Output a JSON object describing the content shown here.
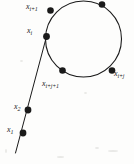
{
  "figure": {
    "background_color": "#fdfdfc",
    "ink_color": "#1a1a1a",
    "width": 134,
    "height": 164
  },
  "geometry": {
    "cycle": {
      "shape": "circle",
      "center_x": 83.5,
      "center_y": 39,
      "radius": 38,
      "stroke_width": 1.1
    },
    "tail": {
      "shape": "line",
      "from_x": 46.5,
      "from_y": 36.5,
      "to_x": 15.5,
      "to_y": 153,
      "stroke_width": 1.0
    }
  },
  "nodes": [
    {
      "id": "x_i_plus_1",
      "cx": 50.5,
      "cy": 10.5,
      "r": 3.3,
      "base": "x",
      "sub": "i+1",
      "label_x": 26,
      "label_y": 3,
      "label_align": "left"
    },
    {
      "id": "x_i_plus_2",
      "cx": 102,
      "cy": 4.5,
      "r": 3.3,
      "base": "",
      "sub": "",
      "label_x": 0,
      "label_y": 0,
      "label_align": "none"
    },
    {
      "id": "x_i",
      "cx": 46.5,
      "cy": 36.5,
      "r": 3.4,
      "base": "x",
      "sub": "i",
      "label_x": 27,
      "label_y": 27,
      "label_align": "left"
    },
    {
      "id": "x_i_plus_j",
      "cx": 112,
      "cy": 70.5,
      "r": 3.3,
      "base": "x",
      "sub": "i+j",
      "label_x": 114,
      "label_y": 70,
      "label_align": "left"
    },
    {
      "id": "x_i_plus_j_1",
      "cx": 62.5,
      "cy": 70.5,
      "r": 3.3,
      "base": "x",
      "sub": "i+j+1",
      "label_x": 42,
      "label_y": 80,
      "label_align": "left"
    },
    {
      "id": "x_2",
      "cx": 28,
      "cy": 110,
      "r": 3.4,
      "base": "x",
      "sub": "2",
      "label_x": 14,
      "label_y": 103,
      "label_align": "left"
    },
    {
      "id": "x_1",
      "cx": 23,
      "cy": 133,
      "r": 3.4,
      "base": "x",
      "sub": "1",
      "label_x": 7,
      "label_y": 126,
      "label_align": "left"
    }
  ],
  "specks": [
    {
      "x": 5,
      "y": 149,
      "w": 2,
      "h": 4
    },
    {
      "x": 57,
      "y": 156,
      "w": 7,
      "h": 2
    },
    {
      "x": 95,
      "y": 147,
      "w": 4,
      "h": 2
    },
    {
      "x": 108,
      "y": 150,
      "w": 10,
      "h": 2
    },
    {
      "x": 20,
      "y": 60,
      "w": 3,
      "h": 2
    },
    {
      "x": 84,
      "y": 92,
      "w": 3,
      "h": 2
    }
  ]
}
